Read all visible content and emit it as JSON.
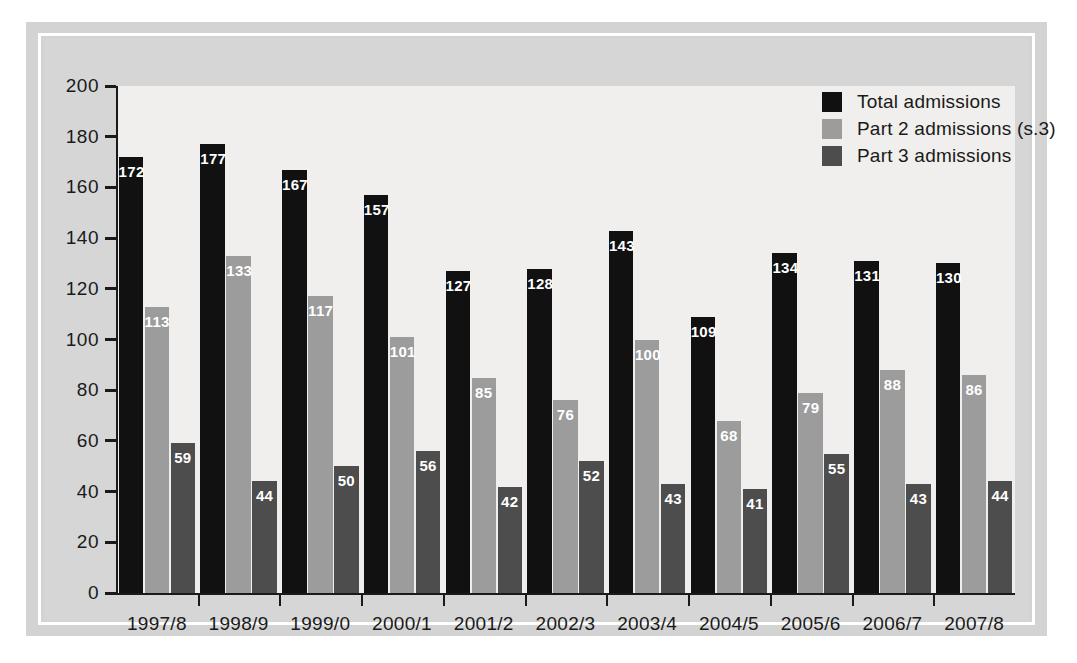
{
  "chart_data": {
    "type": "bar",
    "title": "",
    "subtitle": "",
    "xlabel": "",
    "ylabel": "",
    "ylim": [
      0,
      200
    ],
    "yticks": [
      0,
      20,
      40,
      60,
      80,
      100,
      120,
      140,
      160,
      180,
      200
    ],
    "grid": false,
    "legend_position": "top-right",
    "categories": [
      "1997/8",
      "1998/9",
      "1999/0",
      "2000/1",
      "2001/2",
      "2002/3",
      "2003/4",
      "2004/5",
      "2005/6",
      "2006/7",
      "2007/8"
    ],
    "series": [
      {
        "name": "Total admissions",
        "color": "#111111",
        "values": [
          172,
          177,
          167,
          157,
          127,
          128,
          143,
          109,
          134,
          131,
          130
        ]
      },
      {
        "name": "Part 2 admissions (s.3)",
        "color": "#9c9c9c",
        "values": [
          113,
          133,
          117,
          101,
          85,
          76,
          100,
          68,
          79,
          88,
          86
        ]
      },
      {
        "name": "Part 3 admissions",
        "color": "#4d4d4d",
        "values": [
          59,
          44,
          50,
          56,
          42,
          52,
          43,
          41,
          55,
          43,
          44
        ]
      }
    ]
  },
  "legend": {
    "items": [
      {
        "label": "Total admissions",
        "color": "#111111"
      },
      {
        "label": "Part 2 admissions (s.3)",
        "color": "#9c9c9c"
      },
      {
        "label": "Part 3 admissions",
        "color": "#4d4d4d"
      }
    ]
  }
}
